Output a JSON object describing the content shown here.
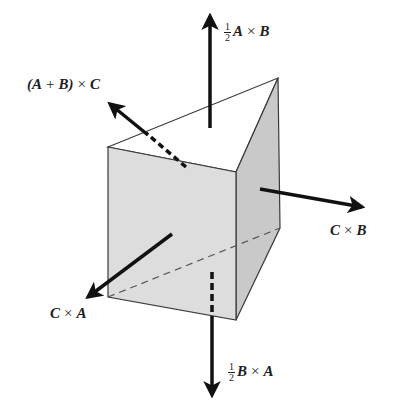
{
  "figure": {
    "colors": {
      "front_face": "#dcdcdc",
      "right_face": "#c8c8c8",
      "top_face": "#ffffff",
      "edge": "#3a3a3a",
      "arrow": "#111111"
    },
    "labels": {
      "top": {
        "coef_num": "1",
        "coef_den": "2",
        "left": "A",
        "op": "×",
        "right": "B"
      },
      "upper_left": {
        "left": "(A",
        "plus": "+",
        "mid": "B)",
        "op": "×",
        "right": "C"
      },
      "right": {
        "left": "C",
        "op": "×",
        "right": "B"
      },
      "lower_left": {
        "left": "C",
        "op": "×",
        "right": "A"
      },
      "bottom": {
        "coef_num": "1",
        "coef_den": "2",
        "left": "B",
        "op": "×",
        "right": "A"
      }
    }
  }
}
